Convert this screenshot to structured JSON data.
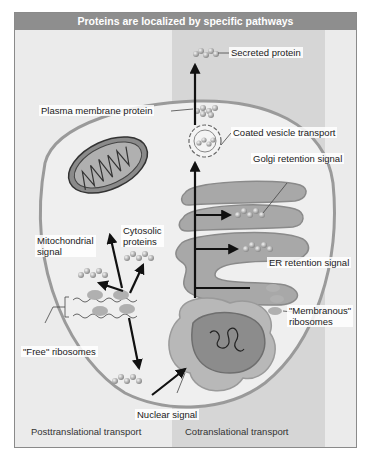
{
  "title": "Proteins are localized by specific pathways",
  "labels": {
    "secreted": "Secreted protein",
    "plasma_membrane": "Plasma membrane protein",
    "coated_vesicle": "Coated vesicle transport",
    "golgi": "Golgi retention signal",
    "er": "ER retention signal",
    "mito_line1": "Mitochondrial",
    "mito_line2": "signal",
    "cyto_line1": "Cytosolic",
    "cyto_line2": "proteins",
    "membranous_line1": "\"Membranous\"",
    "membranous_line2": "ribosomes",
    "free_ribosomes": "\"Free\" ribosomes",
    "nuclear": "Nuclear signal"
  },
  "footer": {
    "left": "Posttranslational transport",
    "right": "Cotranslational transport"
  },
  "colors": {
    "title_bar": "#8e8e8e",
    "background": "#ebebeb",
    "cotranslational_band": "#d6d6d6",
    "membrane": "#9a9a9a",
    "organelle": "#a8a8a8",
    "nucleus": "#8c8c8c"
  }
}
